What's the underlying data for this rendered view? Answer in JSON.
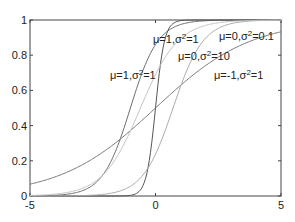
{
  "chart_data": {
    "type": "line",
    "title": "",
    "xlabel": "",
    "ylabel": "",
    "xlim": [
      -5,
      5
    ],
    "ylim": [
      0,
      1
    ],
    "grid": false,
    "legend": "none (inline curve annotations)",
    "x_ticks": [
      -5,
      0,
      5
    ],
    "x_tick_labels": [
      "-5",
      "0",
      "5"
    ],
    "y_ticks": [
      0,
      0.2,
      0.4,
      0.6,
      0.8,
      1
    ],
    "y_tick_labels": [
      "0",
      "0.2",
      "0.4",
      "0.6",
      "0.8",
      "1"
    ],
    "series": [
      {
        "name": "μ=1,σ²=1",
        "mu": -1.0,
        "scale": 0.55,
        "color": "#6e6e6e",
        "x": [
          -5,
          -4,
          -3,
          -2,
          -1,
          0,
          1,
          2,
          3,
          4,
          5
        ],
        "values": [
          0.0,
          0.0,
          0.03,
          0.14,
          0.5,
          0.86,
          0.97,
          1.0,
          1.0,
          1.0,
          1.0
        ]
      },
      {
        "name": "μ=0,σ²=0.1",
        "mu": 0.0,
        "scale": 0.18,
        "color": "#555555",
        "x": [
          -5,
          -4,
          -3,
          -2,
          -1,
          0,
          1,
          2,
          3,
          4,
          5
        ],
        "values": [
          0.0,
          0.0,
          0.0,
          0.0,
          0.0,
          0.5,
          1.0,
          1.0,
          1.0,
          1.0,
          1.0
        ]
      },
      {
        "name": "μ=0,σ²=10",
        "mu": 0.0,
        "scale": 1.9,
        "color": "#777777",
        "x": [
          -5,
          -4,
          -3,
          -2,
          -1,
          0,
          1,
          2,
          3,
          4,
          5
        ],
        "values": [
          0.07,
          0.11,
          0.17,
          0.26,
          0.37,
          0.5,
          0.63,
          0.74,
          0.83,
          0.89,
          0.93
        ]
      },
      {
        "name": "μ=-1,σ²=1",
        "mu": 0.7,
        "scale": 0.6,
        "color": "#aaaaaa",
        "x": [
          -5,
          -4,
          -3,
          -2,
          -1,
          0,
          1,
          2,
          3,
          4,
          5
        ],
        "values": [
          0.0,
          0.0,
          0.0,
          0.01,
          0.06,
          0.24,
          0.62,
          0.9,
          0.98,
          1.0,
          1.0
        ]
      },
      {
        "name": "μ=1,σ²=1",
        "mu": -0.6,
        "scale": 0.75,
        "color": "#c4c4c4",
        "x": [
          -5,
          -4,
          -3,
          -2,
          -1,
          0,
          1,
          2,
          3,
          4,
          5
        ],
        "values": [
          0.0,
          0.01,
          0.04,
          0.13,
          0.37,
          0.69,
          0.89,
          0.97,
          0.99,
          1.0,
          1.0
        ]
      }
    ],
    "annotations": [
      {
        "text_main": "μ=1,σ",
        "sup": "2",
        "text_tail": "=1",
        "x_px": 110,
        "y_px": 79
      },
      {
        "text_main": "μ=1,σ",
        "sup": "2",
        "text_tail": "=1",
        "x_px": 153,
        "y_px": 43
      },
      {
        "text_main": "μ=0,σ",
        "sup": "2",
        "text_tail": "=0.1",
        "x_px": 219,
        "y_px": 40
      },
      {
        "text_main": "μ=0,σ",
        "sup": "2",
        "text_tail": "=10",
        "x_px": 178,
        "y_px": 60
      },
      {
        "text_main": "μ=-1,σ",
        "sup": "2",
        "text_tail": "=1",
        "x_px": 214,
        "y_px": 79
      }
    ]
  }
}
